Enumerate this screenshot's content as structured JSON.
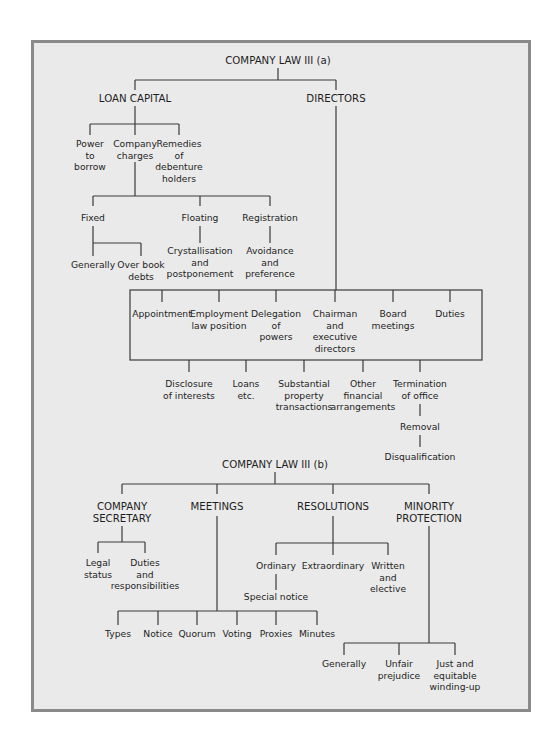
{
  "colors": {
    "frame_fill": "#eaeaea",
    "frame_border": "#8a8a8a",
    "line": "#3a3a3a",
    "text": "#1e1e1e"
  },
  "part_a": {
    "title": "COMPANY LAW III (a)",
    "loan_capital": {
      "label": "LOAN CAPITAL",
      "children": {
        "power": [
          "Power",
          "to",
          "borrow"
        ],
        "charges": [
          "Company",
          "charges"
        ],
        "remedies": [
          "Remedies",
          "of",
          "debenture",
          "holders"
        ]
      },
      "charge_types": {
        "fixed": [
          "Fixed"
        ],
        "floating": [
          "Floating"
        ],
        "registration": [
          "Registration"
        ]
      },
      "fixed_children": {
        "generally": [
          "Generally"
        ],
        "book_debts": [
          "Over book",
          "debts"
        ]
      },
      "floating_child": [
        "Crystallisation",
        "and",
        "postponement"
      ],
      "registration_child": [
        "Avoidance",
        "and",
        "preference"
      ]
    },
    "directors": {
      "label": "DIRECTORS",
      "upper": {
        "appointment": [
          "Appointment"
        ],
        "employment": [
          "Employment",
          "law position"
        ],
        "delegation": [
          "Delegation",
          "of",
          "powers"
        ],
        "chairman": [
          "Chairman",
          "and",
          "executive",
          "directors"
        ],
        "board": [
          "Board",
          "meetings"
        ],
        "duties": [
          "Duties"
        ]
      },
      "lower": {
        "disclosure": [
          "Disclosure",
          "of interests"
        ],
        "loans": [
          "Loans",
          "etc."
        ],
        "property": [
          "Substantial",
          "property",
          "transactions"
        ],
        "financial": [
          "Other",
          "financial",
          "arrangements"
        ],
        "termination": [
          "Termination",
          "of office"
        ]
      },
      "removal": [
        "Removal"
      ],
      "disqualification": [
        "Disqualification"
      ]
    }
  },
  "part_b": {
    "title": "COMPANY LAW III (b)",
    "secretary": {
      "label": [
        "COMPANY",
        "SECRETARY"
      ],
      "children": {
        "legal": [
          "Legal",
          "status"
        ],
        "duties": [
          "Duties",
          "and",
          "responsibilities"
        ]
      }
    },
    "meetings": {
      "label": [
        "MEETINGS"
      ],
      "children": {
        "types": [
          "Types"
        ],
        "notice": [
          "Notice"
        ],
        "quorum": [
          "Quorum"
        ],
        "voting": [
          "Voting"
        ],
        "proxies": [
          "Proxies"
        ],
        "minutes": [
          "Minutes"
        ]
      }
    },
    "resolutions": {
      "label": [
        "RESOLUTIONS"
      ],
      "children": {
        "ordinary": [
          "Ordinary"
        ],
        "extraordinary": [
          "Extraordinary"
        ],
        "written": [
          "Written",
          "and",
          "elective"
        ]
      },
      "special_notice": [
        "Special notice"
      ]
    },
    "minority": {
      "label": [
        "MINORITY",
        "PROTECTION"
      ],
      "children": {
        "generally": [
          "Generally"
        ],
        "unfair": [
          "Unfair",
          "prejudice"
        ],
        "winding": [
          "Just and",
          "equitable",
          "winding-up"
        ]
      }
    }
  }
}
